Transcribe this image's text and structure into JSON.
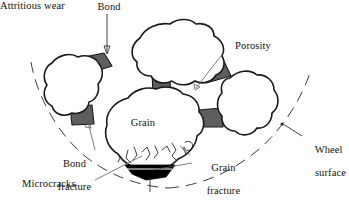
{
  "figure": {
    "background_color": "#ffffff",
    "outline_color": "#1a1a1a",
    "bond_color": "#5e5e5e",
    "wear_color": "#000000",
    "leader_color": "#5a5a5a"
  },
  "labels": {
    "bond": "Bond",
    "porosity": "Porosity",
    "wheel_surface_line1": "Wheel",
    "wheel_surface_line2": "surface",
    "grain": "Grain",
    "bond_fracture_line1": "Bond",
    "bond_fracture_line2": "fracture",
    "microcracks": "Microcracks",
    "grain_fracture_line1": "Grain",
    "grain_fracture_line2": "fracture",
    "attritious_wear": "Attritious wear"
  },
  "parts": {
    "grains": [
      {
        "name": "top-grain",
        "label": ""
      },
      {
        "name": "left-grain",
        "label": ""
      },
      {
        "name": "right-grain",
        "label": ""
      },
      {
        "name": "center-grain",
        "label": "Grain"
      }
    ],
    "bond_bridges": [
      {
        "name": "bond-bridge-top-left"
      },
      {
        "name": "bond-bridge-top-right"
      },
      {
        "name": "bond-bridge-top-center"
      },
      {
        "name": "bond-bridge-lower-left"
      },
      {
        "name": "bond-bridge-lower-right"
      }
    ],
    "features": [
      {
        "name": "porosity-void"
      },
      {
        "name": "attritious-wear-flat"
      },
      {
        "name": "microcrack-network"
      },
      {
        "name": "wheel-surface-arc"
      }
    ]
  }
}
